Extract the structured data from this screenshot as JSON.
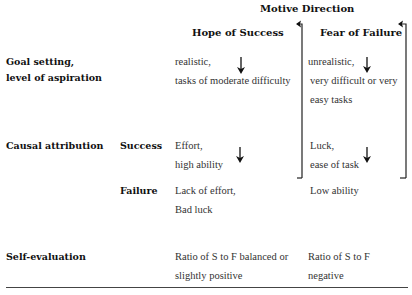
{
  "header": {
    "title": "Motive Direction",
    "col_hope": "Hope of Success",
    "col_fear": "Fear of Failure"
  },
  "rows": {
    "goal": {
      "label_line1": "Goal setting,",
      "label_line2": "level of aspiration",
      "hope_line1": "realistic,",
      "hope_line2": "tasks of moderate difficulty",
      "fear_line1": "unrealistic,",
      "fear_line2": "very difficult or very",
      "fear_line3": "easy tasks"
    },
    "causal": {
      "label": "Causal attribution",
      "success_label": "Success",
      "success_hope_line1": "Effort,",
      "success_hope_line2": "high ability",
      "success_fear_line1": "Luck,",
      "success_fear_line2": "ease of task",
      "failure_label": "Failure",
      "failure_hope_line1": "Lack of effort,",
      "failure_hope_line2": "Bad luck",
      "failure_fear_line1": "Low ability"
    },
    "self_eval": {
      "label": "Self-evaluation",
      "hope_line1": "Ratio of S to F balanced or",
      "hope_line2": "slightly positive",
      "fear_line1": "Ratio of S to F",
      "fear_line2": "negative"
    }
  }
}
